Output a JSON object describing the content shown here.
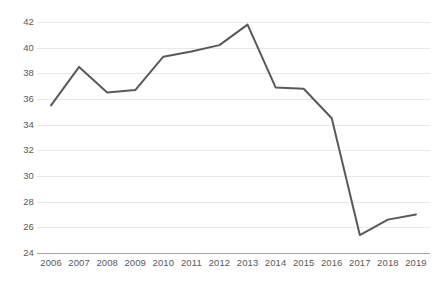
{
  "chart_data": {
    "type": "line",
    "title": "",
    "subtitle": "",
    "xlabel": "",
    "ylabel": "",
    "categories": [
      "2006",
      "2007",
      "2008",
      "2009",
      "2010",
      "2011",
      "2012",
      "2013",
      "2014",
      "2015",
      "2016",
      "2017",
      "2018",
      "2019"
    ],
    "x": [
      2006,
      2007,
      2008,
      2009,
      2010,
      2011,
      2012,
      2013,
      2014,
      2015,
      2016,
      2017,
      2018,
      2019
    ],
    "values": [
      35.5,
      38.5,
      36.5,
      36.7,
      39.3,
      39.7,
      40.2,
      41.8,
      36.9,
      36.8,
      34.5,
      25.4,
      26.6,
      27.0
    ],
    "series": [
      {
        "name": "",
        "values": [
          35.5,
          38.5,
          36.5,
          36.7,
          39.3,
          39.7,
          40.2,
          41.8,
          36.9,
          36.8,
          34.5,
          25.4,
          26.6,
          27.0
        ]
      }
    ],
    "ylim": [
      24,
      42
    ],
    "ytick_values": [
      24,
      26,
      28,
      30,
      32,
      34,
      36,
      38,
      40,
      42
    ],
    "ytick_labels": [
      "24",
      "26",
      "28",
      "30",
      "32",
      "34",
      "36",
      "38",
      "40",
      "42"
    ],
    "xtick_labels": [
      "2006",
      "2007",
      "2008",
      "2009",
      "2010",
      "2011",
      "2012",
      "2013",
      "2014",
      "2015",
      "2016",
      "2017",
      "2018",
      "2019"
    ],
    "grid": true,
    "grid_axis": "y",
    "legend": false,
    "legend_position": "none",
    "annotations": [],
    "colors": {
      "line": "#595959",
      "gridline": "#e8e8e8",
      "axis": "#a6a6a6",
      "tick_label": "#595959",
      "background": "#ffffff"
    },
    "line_width": 2
  }
}
